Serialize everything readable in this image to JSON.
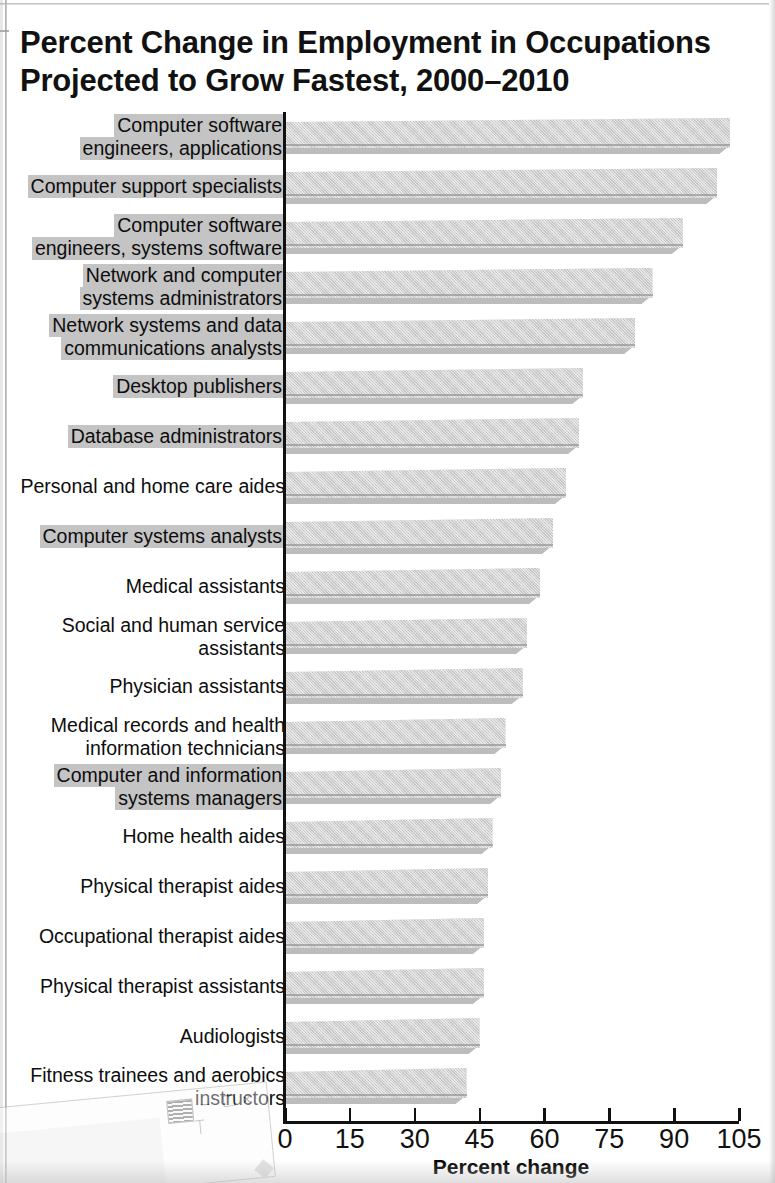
{
  "chart_data": {
    "type": "bar",
    "orientation": "horizontal",
    "title": "Percent Change in Employment in Occupations\nProjected to Grow Fastest, 2000–2010",
    "xlabel": "Percent change",
    "ylabel": "",
    "xlim": [
      0,
      105
    ],
    "xticks": [
      0,
      15,
      30,
      45,
      60,
      75,
      90,
      105
    ],
    "xtick_labels": [
      "0",
      "15",
      "30",
      "45",
      "60",
      "75",
      "90",
      "105"
    ],
    "grid": false,
    "legend": "none",
    "bar_color": "#cfcfcf",
    "highlight_color": "#c4c4c4",
    "categories": [
      "Computer software\nengineers, applications",
      "Computer support specialists",
      "Computer software\nengineers, systems software",
      "Network and computer\nsystems administrators",
      "Network systems and data\ncommunications analysts",
      "Desktop publishers",
      "Database administrators",
      "Personal and home care aides",
      "Computer systems analysts",
      "Medical assistants",
      "Social and human service\nassistants",
      "Physician assistants",
      "Medical records and health\ninformation technicians",
      "Computer and information\nsystems managers",
      "Home health aides",
      "Physical therapist aides",
      "Occupational therapist aides",
      "Physical therapist assistants",
      "Audiologists",
      "Fitness trainees and aerobics\ninstructors"
    ],
    "values": [
      103,
      100,
      92,
      85,
      81,
      69,
      68,
      65,
      62,
      59,
      56,
      55,
      51,
      50,
      48,
      47,
      46,
      46,
      45,
      42
    ],
    "highlighted": [
      true,
      true,
      true,
      true,
      true,
      true,
      true,
      false,
      true,
      false,
      false,
      false,
      false,
      true,
      false,
      false,
      false,
      false,
      false,
      false
    ]
  },
  "artifact": {
    "window_minimize": "–",
    "window_maximize": "❐",
    "window_close": "×"
  }
}
